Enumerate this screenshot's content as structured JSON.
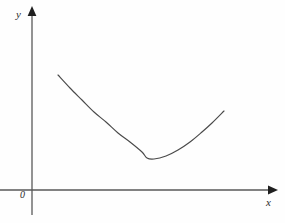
{
  "figure": {
    "background_color": "#fefefe",
    "axis_color": "#595959",
    "curve_color": "#4a4a4a",
    "label_color": "#2b2b2b"
  },
  "labels": {
    "y_axis": "y",
    "x_axis": "x",
    "origin": "0"
  },
  "chart_data": {
    "type": "line",
    "title": "",
    "subtitle": "",
    "xlabel": "x",
    "ylabel": "y",
    "origin_label": "0",
    "grid": false,
    "legend": null,
    "axis_arrows": {
      "x_axis": "right",
      "y_axis": "up"
    },
    "axis_pixel_geometry": {
      "x_axis_y": 190,
      "x_axis_x_start": 0,
      "x_axis_x_end": 272,
      "y_axis_x": 32,
      "y_axis_y_top": 10,
      "y_axis_y_bottom": 215
    },
    "series": [
      {
        "name": "curve",
        "shape": "convex-parabola",
        "x": [
          58,
          70,
          82,
          94,
          106,
          118,
          130,
          142,
          147,
          154,
          166,
          178,
          190,
          202,
          212,
          224
        ],
        "y": [
          75,
          88,
          100,
          112,
          122,
          133,
          142,
          152,
          158,
          159,
          156,
          150,
          142,
          132,
          123,
          111
        ]
      }
    ],
    "annotations": [],
    "xlim": [
      0,
      285
    ],
    "ylim": [
      0,
      223
    ]
  }
}
